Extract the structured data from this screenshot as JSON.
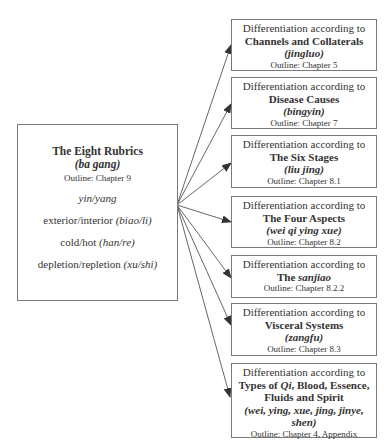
{
  "main": {
    "title": "The Eight Rubrics",
    "pinyin": "(ba gang)",
    "outline": "Outline: Chapter 9",
    "items": [
      {
        "text": "",
        "pinyin": "yin/yang"
      },
      {
        "text": "exterior/interior ",
        "pinyin": "(biao/li)"
      },
      {
        "text": "cold/hot ",
        "pinyin": "(han/re)"
      },
      {
        "text": "depletion/repletion ",
        "pinyin": "(xu/shi)"
      }
    ]
  },
  "lead": "Differentiation according to",
  "boxes": [
    {
      "head": "Channels and Collaterals",
      "pinyin": "(jingluo)",
      "outline": "Outline: Chapter 5"
    },
    {
      "head": "Disease Causes",
      "pinyin": "(bingyin)",
      "outline": "Outline: Chapter 7"
    },
    {
      "head": "The Six Stages",
      "pinyin": "(liu jing)",
      "outline": "Outline: Chapter 8.1"
    },
    {
      "head": "The Four Aspects",
      "pinyin": "(wei qi ying xue)",
      "outline": "Outline: Chapter 8.2"
    },
    {
      "head_pre": "The ",
      "head_em": "sanjiao",
      "outline": "Outline: Chapter 8.2.2"
    },
    {
      "head": "Visceral Systems",
      "pinyin": "(zangfu)",
      "outline": "Outline: Chapter 8.3"
    },
    {
      "head_pre": "Types of ",
      "head_em": "Qi",
      "head_post": ", Blood, Essence,",
      "head2": "Fluids and Spirit",
      "pinyin": "(wei, ying, xue, jing, jinye,",
      "pinyin2": "shen)",
      "outline": "Outline: Chapter 4, Appendix"
    }
  ],
  "colors": {
    "border": "#7a7a7a",
    "text": "#333333",
    "arrow": "#444444"
  }
}
